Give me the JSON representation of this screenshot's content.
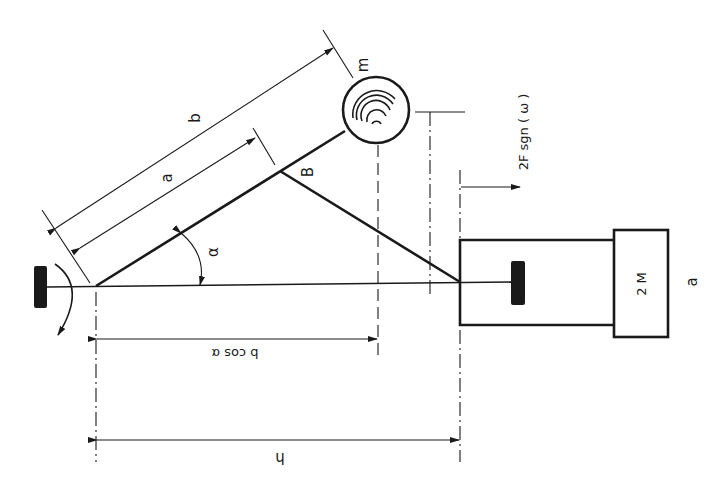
{
  "figure": {
    "panel_label": "a",
    "orientation": "rotated 180 degrees (text appears upside down)",
    "labels": {
      "length_b": "b",
      "length_a": "a",
      "point_b": "B",
      "mass_m": "m",
      "angle": "α",
      "projection": "b cos α",
      "height": "h",
      "mass_2m": "2 M",
      "force": "2F sgn ( ω )"
    },
    "components": [
      {
        "name": "pivot-support",
        "type": "fixed support block"
      },
      {
        "name": "rotation-arrow",
        "type": "curved arrow"
      },
      {
        "name": "arm",
        "type": "rod of length b at angle α"
      },
      {
        "name": "rotor-mass",
        "type": "circle with spiral, mass m"
      },
      {
        "name": "link-rod",
        "type": "rod from point B to carriage"
      },
      {
        "name": "carriage",
        "type": "rectangular slider with inner stop"
      },
      {
        "name": "mass-block",
        "type": "block of mass 2M"
      }
    ]
  }
}
